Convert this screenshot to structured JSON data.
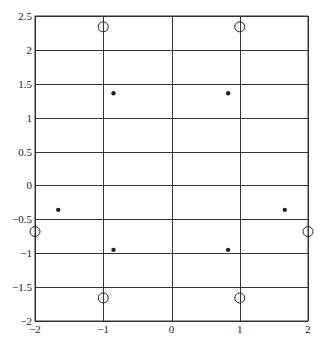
{
  "chart_data": {
    "type": "scatter",
    "title": "",
    "xlabel": "",
    "ylabel": "",
    "xlim": [
      -2,
      2
    ],
    "ylim": [
      -2,
      2.5
    ],
    "grid": true,
    "legend": null,
    "x_ticks": [
      -2,
      -1,
      0,
      1,
      2
    ],
    "x_tick_labels": [
      "-2",
      "-1",
      "0",
      "1",
      "2"
    ],
    "y_ticks": [
      2.5,
      2,
      1.5,
      1,
      0.5,
      0,
      -0.5,
      -1,
      -1.5,
      -2
    ],
    "y_tick_labels": [
      "2.5",
      "2",
      "1.5",
      "1",
      "0.5",
      "0",
      "-0.5",
      "-1",
      "-1.5",
      "-2"
    ],
    "series": [
      {
        "name": "open-circles",
        "marker": "open-circle",
        "points": [
          {
            "x": -1,
            "y": 2.34
          },
          {
            "x": 1,
            "y": 2.34
          },
          {
            "x": -2,
            "y": -0.68
          },
          {
            "x": 2,
            "y": -0.68
          },
          {
            "x": -1,
            "y": -1.66
          },
          {
            "x": 1,
            "y": -1.66
          }
        ]
      },
      {
        "name": "filled-dots",
        "marker": "filled-dot",
        "points": [
          {
            "x": -0.85,
            "y": 1.36
          },
          {
            "x": 0.83,
            "y": 1.36
          },
          {
            "x": -1.66,
            "y": -0.36
          },
          {
            "x": 1.66,
            "y": -0.36
          },
          {
            "x": -0.85,
            "y": -0.95
          },
          {
            "x": 0.83,
            "y": -0.95
          }
        ]
      }
    ]
  },
  "plot_area": {
    "left": 35,
    "top": 16,
    "right": 308,
    "bottom": 321
  },
  "colors": {
    "line": "#333333",
    "marker": "#222222",
    "background": "#ffffff"
  }
}
